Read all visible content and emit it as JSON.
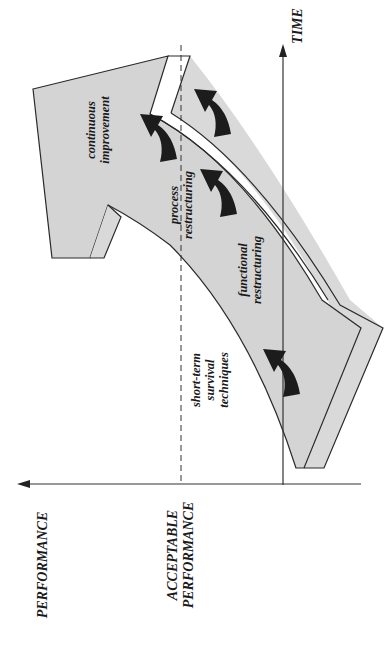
{
  "diagram": {
    "axes": {
      "x_axis_label": "TIME",
      "y_axis_label": "PERFORMANCE",
      "threshold_label_line1": "ACCEPTABLE",
      "threshold_label_line2": "PERFORMANCE"
    },
    "stages": [
      {
        "line1": "short-term",
        "line2": "survival",
        "line3": "techniques"
      },
      {
        "line1": "functional",
        "line2": "restructuring"
      },
      {
        "line1": "process",
        "line2": "restructuring"
      },
      {
        "line1": "continuous",
        "line2": "improvement"
      }
    ],
    "colors": {
      "arrow_fill": "#d4d4d4",
      "arrow_side_fill": "#d9d9d9",
      "stroke": "#2a2a2a",
      "small_arrow_fill": "#1c1c1c",
      "background": "#ffffff"
    },
    "orientation": "rotated 90 degrees counter-clockwise"
  }
}
